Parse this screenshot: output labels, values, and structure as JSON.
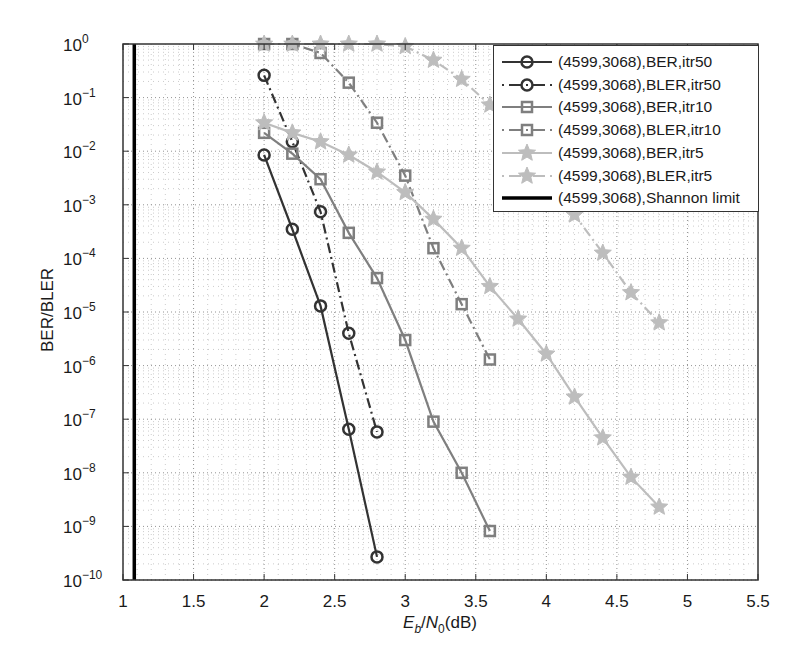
{
  "chart_data": {
    "type": "line",
    "title": "",
    "xlabel": "Eb/N0(dB)",
    "xlabel_parts": {
      "E": "E",
      "sub_b": "b",
      "slash": "/",
      "N": "N",
      "sub_0": "0",
      "unit": "(dB)"
    },
    "ylabel": "BER/BLER",
    "xscale": "linear",
    "yscale": "log",
    "xlim": [
      1,
      5.5
    ],
    "ylim": [
      1e-10,
      1
    ],
    "xticks": [
      1,
      1.5,
      2,
      2.5,
      3,
      3.5,
      4,
      4.5,
      5,
      5.5
    ],
    "xtick_labels": [
      "1",
      "1.5",
      "2",
      "2.5",
      "3",
      "3.5",
      "4",
      "4.5",
      "5",
      "5.5"
    ],
    "yticks_exponents": [
      0,
      -1,
      -2,
      -3,
      -4,
      -5,
      -6,
      -7,
      -8,
      -9,
      -10
    ],
    "ytick_base": "10",
    "grid": "dotted major and minor",
    "legend_position": "upper right",
    "series": [
      {
        "name": "(4599,3068),BER,itr50",
        "color": "#333333",
        "line": "solid",
        "marker": "circle",
        "x": [
          2.0,
          2.2,
          2.4,
          2.6,
          2.8
        ],
        "y": [
          0.0085,
          0.00035,
          1.3e-05,
          6.5e-08,
          2.7e-10
        ]
      },
      {
        "name": "(4599,3068),BLER,itr50",
        "color": "#333333",
        "line": "dashdot",
        "marker": "circle",
        "x": [
          2.0,
          2.2,
          2.4,
          2.6,
          2.8
        ],
        "y": [
          0.26,
          0.015,
          0.00074,
          4e-06,
          5.8e-08
        ]
      },
      {
        "name": "(4599,3068),BER,itr10",
        "color": "#7f7f7f",
        "line": "solid",
        "marker": "square",
        "x": [
          2.0,
          2.2,
          2.4,
          2.6,
          2.8,
          3.0,
          3.2,
          3.4,
          3.6
        ],
        "y": [
          0.022,
          0.009,
          0.003,
          0.0003,
          4.3e-05,
          3e-06,
          9e-08,
          1e-08,
          8.2e-10
        ]
      },
      {
        "name": "(4599,3068),BLER,itr10",
        "color": "#7f7f7f",
        "line": "dashdot",
        "marker": "square",
        "x": [
          2.0,
          2.2,
          2.4,
          2.6,
          2.8,
          3.0,
          3.2,
          3.4,
          3.6
        ],
        "y": [
          1.0,
          1.0,
          0.68,
          0.19,
          0.034,
          0.0035,
          0.000155,
          1.4e-05,
          1.3e-06
        ]
      },
      {
        "name": "(4599,3068),BER,itr5",
        "color": "#bdbdbd",
        "line": "solid",
        "marker": "star",
        "x": [
          2.0,
          2.2,
          2.4,
          2.6,
          2.8,
          3.0,
          3.2,
          3.4,
          3.6,
          3.8,
          4.0,
          4.2,
          4.4,
          4.6,
          4.8
        ],
        "y": [
          0.034,
          0.022,
          0.015,
          0.0085,
          0.0041,
          0.0017,
          0.00054,
          0.000155,
          3e-05,
          7.4e-06,
          1.65e-06,
          2.6e-07,
          4.5e-08,
          8.3e-09,
          2.3e-09
        ]
      },
      {
        "name": "(4599,3068),BLER,itr5",
        "color": "#bdbdbd",
        "line": "dashdot",
        "marker": "star",
        "x": [
          2.0,
          2.2,
          2.4,
          2.6,
          2.8,
          3.0,
          3.2,
          3.4,
          3.6,
          3.8,
          4.0,
          4.2,
          4.4,
          4.6,
          4.8
        ],
        "y": [
          1.0,
          1.0,
          1.0,
          1.0,
          1.0,
          0.9,
          0.5,
          0.22,
          0.073,
          0.02,
          0.004,
          0.00065,
          0.000126,
          2.3e-05,
          6.3e-06
        ]
      },
      {
        "name": "(4599,3068),Shannon limit",
        "color": "#000000",
        "line": "solid-thick",
        "marker": "none",
        "x": [
          1.08,
          1.08
        ],
        "y": [
          1e-10,
          1.0
        ]
      }
    ]
  }
}
